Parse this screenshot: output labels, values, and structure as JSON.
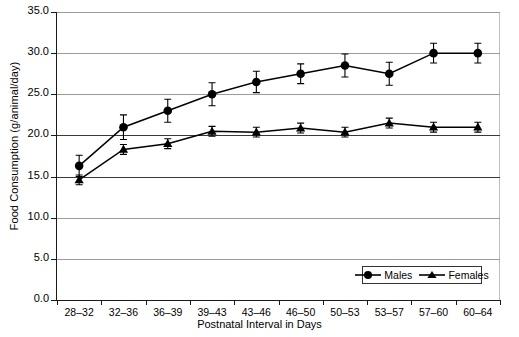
{
  "chart_data": {
    "type": "line",
    "title": "",
    "xlabel": "Postnatal Interval in Days",
    "ylabel": "Food Consumption (g/animal/day)",
    "categories": [
      "28–32",
      "32–36",
      "36–39",
      "39–43",
      "43–46",
      "46–50",
      "50–53",
      "53–57",
      "57–60",
      "60–64"
    ],
    "ylim": [
      0,
      35
    ],
    "y_ticks": [
      "0.0",
      "5.0",
      "10.0",
      "15.0",
      "20.0",
      "25.0",
      "30.0",
      "35.0"
    ],
    "y_tick_values": [
      0,
      5,
      10,
      15,
      20,
      25,
      30,
      35
    ],
    "grid": true,
    "legend_position": "bottom-right",
    "series": [
      {
        "name": "Males",
        "marker": "circle",
        "color": "#000000",
        "values": [
          16.3,
          21.0,
          23.0,
          25.0,
          26.5,
          27.5,
          28.5,
          27.5,
          30.0,
          30.0
        ],
        "errors": [
          1.3,
          1.5,
          1.4,
          1.4,
          1.3,
          1.2,
          1.4,
          1.4,
          1.2,
          1.2
        ]
      },
      {
        "name": "Females",
        "marker": "triangle",
        "color": "#000000",
        "values": [
          14.6,
          18.3,
          19.0,
          20.5,
          20.4,
          20.9,
          20.4,
          21.5,
          21.0,
          21.0
        ],
        "errors": [
          0.6,
          0.6,
          0.6,
          0.6,
          0.6,
          0.6,
          0.6,
          0.6,
          0.6,
          0.6
        ]
      }
    ]
  },
  "legend": {
    "males_label": "Males",
    "females_label": "Females"
  },
  "axes": {
    "x_title": "Postnatal Interval in Days",
    "y_title": "Food Consumption (g/animal/day)"
  }
}
